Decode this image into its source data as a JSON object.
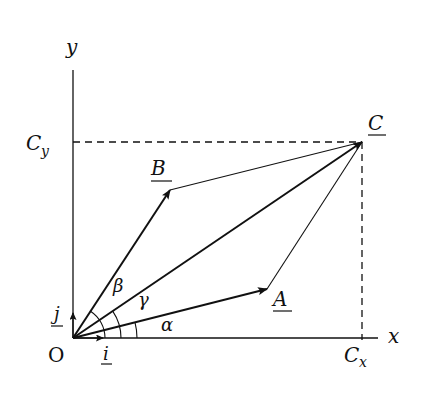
{
  "diagram": {
    "type": "vector-addition",
    "colors": {
      "ink": "#111111",
      "background": "#ffffff"
    },
    "axes": {
      "x_label": "x",
      "y_label": "y",
      "origin_label": "O"
    },
    "unit_vectors": {
      "i_label": "i",
      "j_label": "j"
    },
    "vectors": {
      "A_label": "A",
      "B_label": "B",
      "C_label": "C"
    },
    "components": {
      "cx_label": "C",
      "cx_sub": "x",
      "cy_label": "C",
      "cy_sub": "y"
    },
    "angles": {
      "alpha": "α",
      "beta": "β",
      "gamma": "γ"
    }
  }
}
